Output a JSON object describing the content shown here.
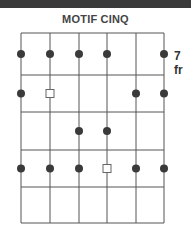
{
  "title": "MOTIF CINQ",
  "fret_label": "7 fr",
  "colors": {
    "topbar": "#3a3a3a",
    "line": "#555555",
    "dot": "#3a3a3a",
    "square_stroke": "#666666"
  },
  "diagram": {
    "strings": 6,
    "frets": 5,
    "string_x": [
      21,
      50,
      79,
      107,
      136,
      164
    ],
    "fret_y": [
      33,
      75,
      112,
      150,
      187,
      223
    ],
    "markers": [
      {
        "fret": 1,
        "string": 1,
        "type": "dot"
      },
      {
        "fret": 1,
        "string": 2,
        "type": "dot"
      },
      {
        "fret": 1,
        "string": 3,
        "type": "dot"
      },
      {
        "fret": 1,
        "string": 4,
        "type": "dot"
      },
      {
        "fret": 1,
        "string": 6,
        "type": "dot"
      },
      {
        "fret": 2,
        "string": 1,
        "type": "dot"
      },
      {
        "fret": 2,
        "string": 2,
        "type": "square"
      },
      {
        "fret": 2,
        "string": 5,
        "type": "dot"
      },
      {
        "fret": 2,
        "string": 6,
        "type": "dot"
      },
      {
        "fret": 3,
        "string": 3,
        "type": "dot"
      },
      {
        "fret": 3,
        "string": 4,
        "type": "dot"
      },
      {
        "fret": 4,
        "string": 1,
        "type": "dot"
      },
      {
        "fret": 4,
        "string": 2,
        "type": "dot"
      },
      {
        "fret": 4,
        "string": 3,
        "type": "dot"
      },
      {
        "fret": 4,
        "string": 4,
        "type": "square"
      },
      {
        "fret": 4,
        "string": 5,
        "type": "dot"
      },
      {
        "fret": 4,
        "string": 6,
        "type": "dot"
      }
    ]
  }
}
